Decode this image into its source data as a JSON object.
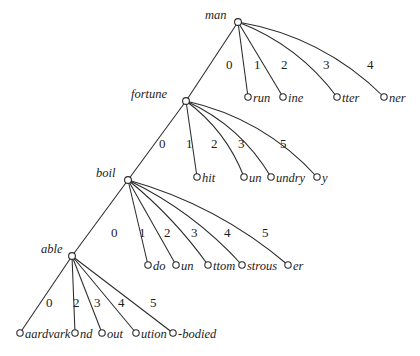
{
  "figure": {
    "kind": "suffix-trie-diagram",
    "width": 420,
    "height": 356,
    "background_color": "#ffffff",
    "ink_color": "#2b2b2b"
  },
  "nodes": {
    "man": {
      "label": "man",
      "x": 238,
      "y": 22,
      "label_x": 205,
      "label_y": 9
    },
    "fortune": {
      "label": "fortune",
      "x": 186,
      "y": 101,
      "label_x": 131,
      "label_y": 88
    },
    "boil": {
      "label": "boil",
      "x": 128,
      "y": 180,
      "label_x": 96,
      "label_y": 167
    },
    "able": {
      "label": "able",
      "x": 72,
      "y": 256,
      "label_x": 41,
      "label_y": 243
    }
  },
  "leaves": [
    {
      "id": "run",
      "label": "run",
      "x": 248,
      "y": 97,
      "label_x": 253,
      "label_y": 92,
      "parent": "man"
    },
    {
      "id": "ine",
      "label": "ine",
      "x": 283,
      "y": 97,
      "label_x": 288,
      "label_y": 92,
      "parent": "man"
    },
    {
      "id": "tter",
      "label": "tter",
      "x": 337,
      "y": 97,
      "label_x": 342,
      "label_y": 92,
      "parent": "man"
    },
    {
      "id": "ner",
      "label": "ner",
      "x": 384,
      "y": 97,
      "label_x": 389,
      "label_y": 92,
      "parent": "man"
    },
    {
      "id": "hit",
      "label": "hit",
      "x": 197,
      "y": 177,
      "label_x": 202,
      "label_y": 172,
      "parent": "fortune"
    },
    {
      "id": "un-f",
      "label": "un",
      "x": 244,
      "y": 177,
      "label_x": 249,
      "label_y": 172,
      "parent": "fortune"
    },
    {
      "id": "undry",
      "label": "undry",
      "x": 271,
      "y": 177,
      "label_x": 276,
      "label_y": 172,
      "parent": "fortune"
    },
    {
      "id": "y",
      "label": "y",
      "x": 317,
      "y": 177,
      "label_x": 322,
      "label_y": 172,
      "parent": "fortune"
    },
    {
      "id": "do",
      "label": "do",
      "x": 148,
      "y": 265,
      "label_x": 153,
      "label_y": 260,
      "parent": "boil"
    },
    {
      "id": "un-b",
      "label": "un",
      "x": 176,
      "y": 265,
      "label_x": 181,
      "label_y": 260,
      "parent": "boil"
    },
    {
      "id": "ttom",
      "label": "ttom",
      "x": 208,
      "y": 265,
      "label_x": 213,
      "label_y": 260,
      "parent": "boil"
    },
    {
      "id": "strous",
      "label": "strous",
      "x": 242,
      "y": 265,
      "label_x": 247,
      "label_y": 260,
      "parent": "boil"
    },
    {
      "id": "er",
      "label": "er",
      "x": 288,
      "y": 265,
      "label_x": 293,
      "label_y": 260,
      "parent": "boil"
    },
    {
      "id": "aardvark",
      "label": "aardvark",
      "x": 20,
      "y": 333,
      "label_x": 25,
      "label_y": 328,
      "parent": "able"
    },
    {
      "id": "nd",
      "label": "nd",
      "x": 75,
      "y": 333,
      "label_x": 80,
      "label_y": 328,
      "parent": "able"
    },
    {
      "id": "out",
      "label": "out",
      "x": 102,
      "y": 333,
      "label_x": 107,
      "label_y": 328,
      "parent": "able"
    },
    {
      "id": "ution",
      "label": "ution",
      "x": 136,
      "y": 333,
      "label_x": 141,
      "label_y": 328,
      "parent": "able"
    },
    {
      "id": "-bodied",
      "label": "-bodied",
      "x": 173,
      "y": 333,
      "label_x": 178,
      "label_y": 328,
      "parent": "able"
    }
  ],
  "edges": [
    {
      "from": "man",
      "to": "fortune",
      "label": "",
      "label_x": 0,
      "label_y": 0,
      "curve": 0
    },
    {
      "from": "man",
      "to": "run",
      "label": "0",
      "label_x": 226,
      "label_y": 58,
      "curve": 0
    },
    {
      "from": "man",
      "to": "ine",
      "label": "1",
      "label_x": 254,
      "label_y": 58,
      "curve": 0
    },
    {
      "from": "man",
      "to": "tter",
      "label": "2",
      "label_x": 281,
      "label_y": 58,
      "curve": 18
    },
    {
      "from": "man",
      "to": "ner",
      "label": "3",
      "label_x": 323,
      "label_y": 58,
      "curve": 26
    },
    {
      "from": "man",
      "to": "",
      "label": "4",
      "label_x": 367,
      "label_y": 58,
      "curve": 0
    },
    {
      "from": "fortune",
      "to": "boil",
      "label": "0",
      "label_x": 159,
      "label_y": 137,
      "curve": 0
    },
    {
      "from": "fortune",
      "to": "hit",
      "label": "1",
      "label_x": 186,
      "label_y": 137,
      "curve": 0
    },
    {
      "from": "fortune",
      "to": "un-f",
      "label": "2",
      "label_x": 211,
      "label_y": 137,
      "curve": 14
    },
    {
      "from": "fortune",
      "to": "undry",
      "label": "3",
      "label_x": 238,
      "label_y": 137,
      "curve": 18
    },
    {
      "from": "fortune",
      "to": "y",
      "label": "5",
      "label_x": 280,
      "label_y": 137,
      "curve": 24
    },
    {
      "from": "boil",
      "to": "able",
      "label": "0",
      "label_x": 111,
      "label_y": 226,
      "curve": 0
    },
    {
      "from": "boil",
      "to": "do",
      "label": "1",
      "label_x": 139,
      "label_y": 226,
      "curve": 0
    },
    {
      "from": "boil",
      "to": "un-b",
      "label": "2",
      "label_x": 164,
      "label_y": 226,
      "curve": 0
    },
    {
      "from": "boil",
      "to": "ttom",
      "label": "3",
      "label_x": 191,
      "label_y": 226,
      "curve": 8
    },
    {
      "from": "boil",
      "to": "strous",
      "label": "4",
      "label_x": 224,
      "label_y": 226,
      "curve": 14
    },
    {
      "from": "boil",
      "to": "er",
      "label": "5",
      "label_x": 262,
      "label_y": 226,
      "curve": 20
    },
    {
      "from": "able",
      "to": "aardvark",
      "label": "0",
      "label_x": 46,
      "label_y": 296,
      "curve": 0
    },
    {
      "from": "able",
      "to": "nd",
      "label": "2",
      "label_x": 73,
      "label_y": 296,
      "curve": 0
    },
    {
      "from": "able",
      "to": "out",
      "label": "3",
      "label_x": 94,
      "label_y": 296,
      "curve": 0
    },
    {
      "from": "able",
      "to": "ution",
      "label": "4",
      "label_x": 118,
      "label_y": 296,
      "curve": 0
    },
    {
      "from": "able",
      "to": "-bodied",
      "label": "5",
      "label_x": 150,
      "label_y": 296,
      "curve": 0
    }
  ]
}
